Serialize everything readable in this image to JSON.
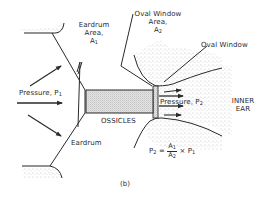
{
  "figure": {
    "panel_label": "(b)"
  },
  "labels": {
    "eardrum_area": {
      "line1": "Eardrum",
      "line2": "Area,",
      "symbol": "A",
      "subscript": "1"
    },
    "oval_window_area": {
      "line1": "Oval Window",
      "line2": "Area,",
      "symbol": "A",
      "subscript": "2"
    },
    "oval_window": "Oval Window",
    "pressure_in": {
      "text": "Pressure,",
      "symbol": "P",
      "subscript": "1"
    },
    "pressure_out": {
      "text": "Pressure,",
      "symbol": "P",
      "subscript": "2"
    },
    "ossicles": "OSSICLES",
    "inner_ear": {
      "line1": "INNER",
      "line2": "EAR"
    },
    "eardrum": "Eardrum"
  },
  "formula": {
    "lhs": "P",
    "lhs_sub": "2",
    "equals": "=",
    "num": "A",
    "num_sub": "1",
    "den": "A",
    "den_sub": "2",
    "times": "×",
    "rhs": "P",
    "rhs_sub": "1",
    "text": "P2 = A1 / A2 × P1"
  },
  "colors": {
    "ink": "#2a2a2a",
    "shade": "#cfcfcf",
    "stipple": "#9a9a9a",
    "background": "#ffffff"
  }
}
